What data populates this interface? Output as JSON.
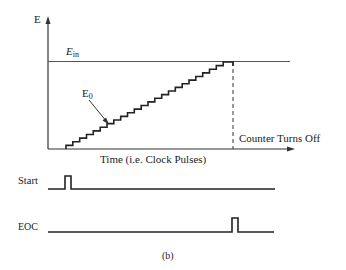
{
  "diagram": {
    "y_axis_label": "E",
    "ein_label": "E",
    "ein_subscript": "in",
    "e0_label": "E",
    "e0_subscript": "0",
    "x_axis_label": "Time (i.e. Clock Pulses)",
    "counter_label": "Counter Turns Off",
    "start_label": "Start",
    "eoc_label": "EOC",
    "caption": "(b)",
    "steps": 24
  }
}
